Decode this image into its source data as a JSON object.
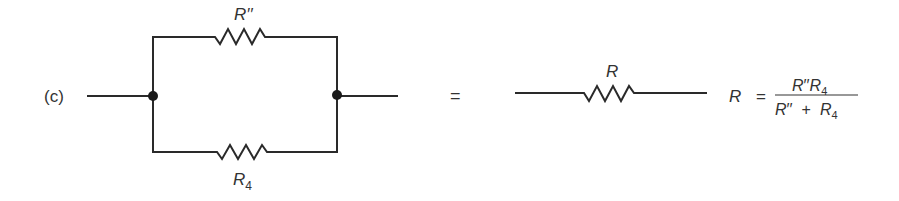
{
  "figure": {
    "part_label": "(c)",
    "equals_sign": "=",
    "parallel_circuit": {
      "top_resistor": {
        "symbol": "R",
        "primes": "′′"
      },
      "bottom_resistor": {
        "symbol": "R",
        "subscript": "4"
      }
    },
    "equivalent_circuit": {
      "resistor": {
        "symbol": "R"
      }
    },
    "formula": {
      "lhs": "R",
      "equals": "=",
      "numerator": {
        "a_symbol": "R",
        "a_primes": "′′",
        "b_symbol": "R",
        "b_subscript": "4"
      },
      "denominator": {
        "a_symbol": "R",
        "a_primes": "′′",
        "plus": "+",
        "b_symbol": "R",
        "b_subscript": "4"
      }
    }
  },
  "colors": {
    "line": "#2a2a2a",
    "text": "#333333",
    "background": "#ffffff"
  }
}
